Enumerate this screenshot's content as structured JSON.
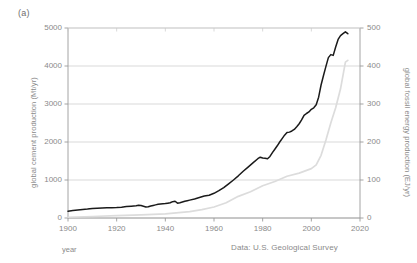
{
  "panel": {
    "label": "(a)"
  },
  "axes": {
    "left": {
      "title": "global cement production (Mt/yr)",
      "ticks": [
        0,
        1000,
        2000,
        3000,
        4000,
        5000
      ],
      "min": 0,
      "max": 5000
    },
    "right": {
      "title": "global fossil energy production (EJ/yr)",
      "ticks": [
        0,
        100,
        200,
        300,
        400,
        500
      ],
      "min": 0,
      "max": 500
    },
    "x": {
      "title": "year",
      "ticks": [
        1900,
        1920,
        1940,
        1960,
        1980,
        2000,
        2020
      ],
      "min": 1900,
      "max": 2020
    }
  },
  "source_note": "Data: U.S. Geological Survey",
  "colors": {
    "cement_line": "#1a1a1a",
    "energy_line": "#dcdcdc",
    "grid": "#c8c8c8",
    "axis": "#9a9a9a",
    "text": "#8a8a8a"
  },
  "chart_data": {
    "type": "line",
    "title": "",
    "xlabel": "year",
    "ylabel": "global cement production (Mt/yr)",
    "y2label": "global fossil energy production (EJ/yr)",
    "xlim": [
      1900,
      2020
    ],
    "ylim": [
      0,
      5000
    ],
    "y2lim": [
      0,
      500
    ],
    "grid": true,
    "legend": "none",
    "annotations": [
      "(a)",
      "Data: U.S. Geological Survey"
    ],
    "series": [
      {
        "name": "global cement production",
        "axis": "left",
        "units": "Mt/yr",
        "color": "#1a1a1a",
        "x": [
          1900,
          1902,
          1904,
          1906,
          1908,
          1910,
          1912,
          1914,
          1916,
          1918,
          1920,
          1922,
          1924,
          1926,
          1928,
          1929,
          1930,
          1931,
          1932,
          1933,
          1934,
          1935,
          1936,
          1937,
          1938,
          1939,
          1940,
          1941,
          1942,
          1943,
          1944,
          1945,
          1946,
          1947,
          1948,
          1949,
          1950,
          1952,
          1954,
          1956,
          1958,
          1960,
          1962,
          1964,
          1966,
          1968,
          1970,
          1972,
          1974,
          1976,
          1978,
          1979,
          1980,
          1981,
          1982,
          1983,
          1984,
          1985,
          1986,
          1987,
          1988,
          1989,
          1990,
          1991,
          1992,
          1993,
          1994,
          1995,
          1996,
          1997,
          1998,
          1999,
          2000,
          2001,
          2002,
          2003,
          2004,
          2005,
          2006,
          2007,
          2008,
          2009,
          2010,
          2011,
          2012,
          2013,
          2014,
          2015
        ],
        "y": [
          180,
          195,
          210,
          225,
          235,
          250,
          258,
          265,
          270,
          268,
          275,
          285,
          300,
          312,
          325,
          335,
          330,
          310,
          290,
          295,
          315,
          330,
          345,
          360,
          370,
          375,
          380,
          390,
          400,
          430,
          440,
          390,
          400,
          420,
          440,
          455,
          470,
          500,
          540,
          580,
          600,
          650,
          720,
          800,
          900,
          1000,
          1110,
          1230,
          1340,
          1450,
          1560,
          1600,
          1580,
          1570,
          1560,
          1620,
          1720,
          1810,
          1900,
          2000,
          2090,
          2180,
          2250,
          2260,
          2290,
          2330,
          2400,
          2480,
          2580,
          2700,
          2750,
          2790,
          2860,
          2900,
          2980,
          3180,
          3500,
          3750,
          3990,
          4220,
          4300,
          4280,
          4500,
          4700,
          4800,
          4850,
          4900,
          4850
        ]
      },
      {
        "name": "global fossil energy production",
        "axis": "right",
        "units": "EJ/yr",
        "color": "#dcdcdc",
        "x": [
          1900,
          1910,
          1920,
          1930,
          1940,
          1950,
          1955,
          1960,
          1965,
          1970,
          1975,
          1980,
          1985,
          1990,
          1995,
          2000,
          2002,
          2004,
          2006,
          2008,
          2010,
          2012,
          2014,
          2015
        ],
        "y": [
          2,
          4,
          6,
          8,
          11,
          17,
          22,
          29,
          40,
          57,
          69,
          85,
          96,
          110,
          118,
          130,
          140,
          165,
          205,
          250,
          290,
          340,
          410,
          415
        ]
      }
    ]
  }
}
